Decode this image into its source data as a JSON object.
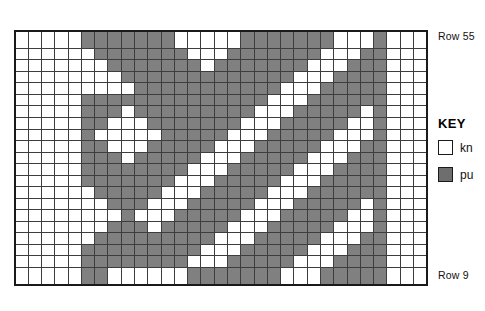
{
  "chart_data": {
    "type": "heatmap",
    "columns": 31,
    "rows": 21,
    "row_top_label": "Row 55",
    "row_bottom_label": "Row 9",
    "legend_position": "right",
    "value_legend": {
      "0": "knit",
      "1": "purl"
    },
    "colors": {
      "knit": "#ffffff",
      "purl": "#808080",
      "grid_line": "#3d3d3d",
      "border": "#1a1a1a"
    },
    "grid": [
      [
        0,
        0,
        0,
        0,
        0,
        1,
        1,
        1,
        1,
        1,
        1,
        1,
        0,
        0,
        0,
        0,
        0,
        1,
        1,
        1,
        1,
        1,
        1,
        1,
        0,
        0,
        0,
        1,
        0,
        0,
        0
      ],
      [
        0,
        0,
        0,
        0,
        0,
        0,
        1,
        1,
        1,
        1,
        1,
        1,
        1,
        0,
        0,
        0,
        1,
        1,
        1,
        1,
        1,
        1,
        1,
        0,
        0,
        0,
        1,
        1,
        0,
        0,
        0
      ],
      [
        0,
        0,
        0,
        0,
        0,
        0,
        0,
        1,
        1,
        1,
        1,
        1,
        1,
        1,
        0,
        1,
        1,
        1,
        1,
        1,
        1,
        1,
        0,
        0,
        0,
        1,
        1,
        1,
        0,
        0,
        0
      ],
      [
        0,
        0,
        0,
        0,
        0,
        0,
        0,
        0,
        1,
        1,
        1,
        1,
        1,
        1,
        1,
        1,
        1,
        1,
        1,
        1,
        1,
        0,
        0,
        0,
        1,
        1,
        1,
        1,
        0,
        0,
        0
      ],
      [
        0,
        0,
        0,
        0,
        0,
        0,
        0,
        0,
        0,
        1,
        1,
        1,
        1,
        1,
        1,
        1,
        1,
        1,
        1,
        1,
        0,
        0,
        0,
        1,
        1,
        1,
        1,
        1,
        0,
        0,
        0
      ],
      [
        0,
        0,
        0,
        0,
        0,
        1,
        1,
        1,
        1,
        1,
        1,
        1,
        1,
        1,
        1,
        1,
        1,
        1,
        1,
        0,
        0,
        0,
        1,
        1,
        1,
        1,
        1,
        1,
        0,
        0,
        0
      ],
      [
        0,
        0,
        0,
        0,
        0,
        1,
        1,
        1,
        0,
        1,
        1,
        1,
        1,
        1,
        1,
        1,
        1,
        1,
        0,
        0,
        0,
        1,
        1,
        1,
        1,
        1,
        0,
        1,
        0,
        0,
        0
      ],
      [
        0,
        0,
        0,
        0,
        0,
        1,
        1,
        0,
        0,
        0,
        1,
        1,
        1,
        1,
        1,
        1,
        1,
        0,
        0,
        0,
        1,
        1,
        1,
        1,
        1,
        0,
        0,
        1,
        0,
        0,
        0
      ],
      [
        0,
        0,
        0,
        0,
        0,
        1,
        0,
        0,
        0,
        0,
        0,
        1,
        1,
        1,
        1,
        1,
        0,
        0,
        0,
        1,
        1,
        1,
        1,
        1,
        0,
        0,
        0,
        1,
        0,
        0,
        0
      ],
      [
        0,
        0,
        0,
        0,
        0,
        1,
        1,
        0,
        0,
        0,
        1,
        1,
        1,
        1,
        1,
        0,
        0,
        0,
        1,
        1,
        1,
        1,
        1,
        0,
        0,
        0,
        1,
        1,
        0,
        0,
        0
      ],
      [
        0,
        0,
        0,
        0,
        0,
        1,
        1,
        1,
        0,
        1,
        1,
        1,
        1,
        1,
        0,
        0,
        0,
        1,
        1,
        1,
        1,
        1,
        0,
        0,
        0,
        1,
        1,
        1,
        0,
        0,
        0
      ],
      [
        0,
        0,
        0,
        0,
        0,
        1,
        1,
        1,
        1,
        1,
        1,
        1,
        1,
        0,
        0,
        0,
        1,
        1,
        1,
        1,
        1,
        0,
        0,
        0,
        1,
        1,
        1,
        1,
        0,
        0,
        0
      ],
      [
        0,
        0,
        0,
        0,
        0,
        1,
        1,
        1,
        1,
        1,
        1,
        1,
        0,
        0,
        0,
        1,
        1,
        1,
        1,
        1,
        0,
        0,
        0,
        1,
        1,
        1,
        1,
        1,
        0,
        0,
        0
      ],
      [
        0,
        0,
        0,
        0,
        0,
        0,
        1,
        1,
        1,
        1,
        1,
        0,
        0,
        0,
        1,
        1,
        1,
        1,
        1,
        0,
        0,
        0,
        1,
        1,
        1,
        1,
        1,
        1,
        0,
        0,
        0
      ],
      [
        0,
        0,
        0,
        0,
        0,
        0,
        0,
        1,
        1,
        1,
        0,
        0,
        0,
        1,
        1,
        1,
        1,
        1,
        0,
        0,
        0,
        1,
        1,
        1,
        1,
        1,
        0,
        1,
        0,
        0,
        0
      ],
      [
        0,
        0,
        0,
        0,
        0,
        0,
        0,
        0,
        1,
        0,
        0,
        0,
        1,
        1,
        1,
        1,
        1,
        0,
        0,
        0,
        1,
        1,
        1,
        1,
        1,
        0,
        0,
        1,
        0,
        0,
        0
      ],
      [
        0,
        0,
        0,
        0,
        0,
        0,
        0,
        1,
        1,
        1,
        0,
        1,
        1,
        1,
        1,
        1,
        0,
        0,
        0,
        1,
        1,
        1,
        1,
        1,
        0,
        0,
        0,
        1,
        0,
        0,
        0
      ],
      [
        0,
        0,
        0,
        0,
        0,
        0,
        1,
        1,
        1,
        1,
        1,
        1,
        1,
        1,
        1,
        0,
        0,
        0,
        1,
        1,
        1,
        1,
        1,
        0,
        0,
        0,
        1,
        1,
        0,
        0,
        0
      ],
      [
        0,
        0,
        0,
        0,
        0,
        1,
        1,
        1,
        1,
        1,
        1,
        1,
        1,
        1,
        0,
        0,
        0,
        1,
        1,
        1,
        1,
        1,
        0,
        0,
        0,
        1,
        1,
        1,
        0,
        0,
        0
      ],
      [
        0,
        0,
        0,
        0,
        0,
        1,
        1,
        1,
        1,
        1,
        1,
        1,
        1,
        0,
        0,
        0,
        1,
        1,
        1,
        1,
        1,
        0,
        0,
        0,
        1,
        1,
        1,
        1,
        0,
        0,
        0
      ],
      [
        0,
        0,
        0,
        0,
        0,
        1,
        1,
        0,
        0,
        0,
        0,
        0,
        0,
        1,
        1,
        1,
        1,
        1,
        1,
        1,
        0,
        0,
        0,
        1,
        1,
        1,
        1,
        1,
        0,
        0,
        0
      ]
    ]
  },
  "labels": {
    "row_top": "Row 55",
    "row_bottom": "Row 9"
  },
  "key": {
    "title": "KEY",
    "entries": [
      {
        "swatch": "knit",
        "label": "kn"
      },
      {
        "swatch": "purl",
        "label": "pu"
      }
    ]
  }
}
